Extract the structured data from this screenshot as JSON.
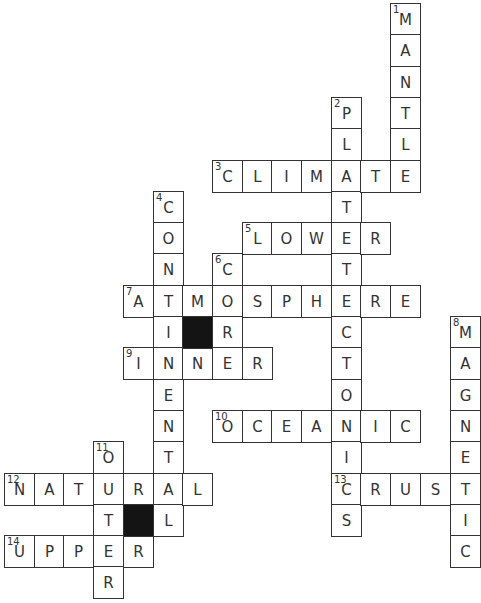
{
  "puzzle": {
    "layout": {
      "col_x0": 4,
      "col_w": 29.7,
      "row_y0": 3,
      "row_h": 31.3
    },
    "colors": {
      "line": "#333333",
      "fill": "#ffffff",
      "block": "#141414"
    },
    "entries": [
      {
        "number": 1,
        "direction": "down",
        "answer": "MANTLE",
        "row": 0,
        "col": 13
      },
      {
        "number": 2,
        "direction": "down",
        "answer": "PLATETECTONICS",
        "row": 3,
        "col": 11
      },
      {
        "number": 3,
        "direction": "across",
        "answer": "CLIMATE",
        "row": 5,
        "col": 7
      },
      {
        "number": 4,
        "direction": "down",
        "answer": "CONTINENTAL",
        "row": 6,
        "col": 5
      },
      {
        "number": 5,
        "direction": "across",
        "answer": "LOWER",
        "row": 7,
        "col": 8
      },
      {
        "number": 6,
        "direction": "down",
        "answer": "CORE",
        "row": 8,
        "col": 7
      },
      {
        "number": 7,
        "direction": "across",
        "answer": "ATMOSPHERE",
        "row": 9,
        "col": 4
      },
      {
        "number": 8,
        "direction": "down",
        "answer": "MAGNETIC",
        "row": 10,
        "col": 15
      },
      {
        "number": 9,
        "direction": "across",
        "answer": "INNER",
        "row": 11,
        "col": 4
      },
      {
        "number": 10,
        "direction": "across",
        "answer": "OCEANIC",
        "row": 13,
        "col": 7
      },
      {
        "number": 11,
        "direction": "down",
        "answer": "OUTER",
        "row": 14,
        "col": 3
      },
      {
        "number": 12,
        "direction": "across",
        "answer": "NATURAL",
        "row": 15,
        "col": 0
      },
      {
        "number": 13,
        "direction": "across",
        "answer": "CRUST",
        "row": 15,
        "col": 11
      },
      {
        "number": 14,
        "direction": "across",
        "answer": "UPPER",
        "row": 17,
        "col": 0
      }
    ],
    "black_cells": [
      {
        "row": 10,
        "col": 6
      },
      {
        "row": 16,
        "col": 4
      }
    ]
  }
}
